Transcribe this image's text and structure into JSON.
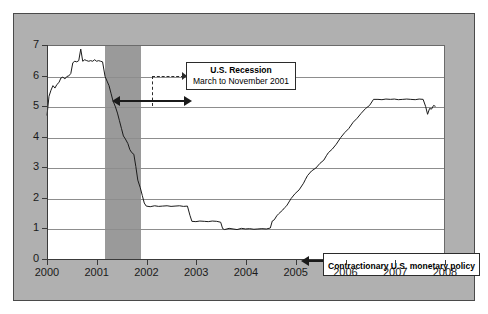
{
  "figure": {
    "background_color": "#b0b0b0",
    "plot_background_color": "#ffffff",
    "border_color": "#4a4a4a"
  },
  "annotations": {
    "recession": {
      "line1": "U.S. Recession",
      "line2": "March to November 2001",
      "band_start": 2001.17,
      "band_end": 2001.88,
      "band_color": "#9a9a9a"
    },
    "policy": {
      "label": "Contractionary U.S. monetary policy",
      "arrow_target_x": 2004.5,
      "arrow_target_y": 1.0
    }
  },
  "chart_data": {
    "type": "line",
    "title": "",
    "subtitle": "",
    "xlabel": "",
    "ylabel": "Percent",
    "xlim": [
      2000,
      2008
    ],
    "ylim": [
      0,
      7
    ],
    "grid": true,
    "legend_position": "none",
    "xticks": [
      2000,
      2001,
      2002,
      2003,
      2004,
      2005,
      2006,
      2007,
      2008
    ],
    "xticklabels": [
      "2000",
      "2001",
      "2002",
      "2003",
      "2004",
      "2005",
      "2006",
      "2007",
      "2008"
    ],
    "yticks": [
      0,
      1,
      2,
      3,
      4,
      5,
      6,
      7
    ],
    "yticklabels": [
      "0",
      "1",
      "2",
      "3",
      "4",
      "5",
      "6",
      "7"
    ],
    "line_color": "#1a1a1a",
    "series": [
      {
        "name": "Federal funds rate",
        "x": [
          2000.0,
          2000.04,
          2000.08,
          2000.12,
          2000.16,
          2000.2,
          2000.24,
          2000.28,
          2000.32,
          2000.36,
          2000.4,
          2000.44,
          2000.48,
          2000.52,
          2000.56,
          2000.6,
          2000.64,
          2000.68,
          2000.72,
          2000.76,
          2000.8,
          2000.84,
          2000.88,
          2000.92,
          2000.96,
          2001.0,
          2001.04,
          2001.08,
          2001.12,
          2001.17,
          2001.21,
          2001.25,
          2001.29,
          2001.33,
          2001.38,
          2001.42,
          2001.46,
          2001.5,
          2001.54,
          2001.58,
          2001.63,
          2001.67,
          2001.71,
          2001.75,
          2001.79,
          2001.83,
          2001.88,
          2001.92,
          2001.96,
          2002.0,
          2002.08,
          2002.17,
          2002.25,
          2002.33,
          2002.42,
          2002.5,
          2002.58,
          2002.67,
          2002.75,
          2002.83,
          2002.88,
          2002.92,
          2003.0,
          2003.08,
          2003.17,
          2003.25,
          2003.33,
          2003.42,
          2003.5,
          2003.54,
          2003.58,
          2003.67,
          2003.75,
          2003.83,
          2003.92,
          2004.0,
          2004.08,
          2004.17,
          2004.25,
          2004.33,
          2004.42,
          2004.5,
          2004.54,
          2004.58,
          2004.63,
          2004.67,
          2004.75,
          2004.79,
          2004.83,
          2004.92,
          2005.0,
          2005.08,
          2005.17,
          2005.21,
          2005.25,
          2005.33,
          2005.42,
          2005.5,
          2005.58,
          2005.63,
          2005.67,
          2005.75,
          2005.83,
          2005.92,
          2006.0,
          2006.08,
          2006.17,
          2006.25,
          2006.33,
          2006.42,
          2006.5,
          2006.58,
          2006.67,
          2006.75,
          2006.83,
          2006.92,
          2007.0,
          2007.08,
          2007.17,
          2007.25,
          2007.33,
          2007.42,
          2007.5,
          2007.58,
          2007.63,
          2007.67,
          2007.71,
          2007.75,
          2007.79,
          2007.83
        ],
        "y": [
          4.72,
          5.35,
          5.55,
          5.7,
          5.62,
          5.74,
          5.8,
          5.95,
          5.98,
          5.92,
          6.0,
          6.02,
          6.1,
          6.45,
          6.5,
          6.48,
          6.52,
          6.9,
          6.5,
          6.55,
          6.52,
          6.5,
          6.52,
          6.5,
          6.55,
          6.5,
          6.52,
          6.5,
          6.48,
          6.0,
          5.85,
          5.7,
          5.45,
          5.2,
          5.0,
          4.8,
          4.55,
          4.3,
          4.05,
          3.95,
          3.8,
          3.6,
          3.5,
          3.45,
          3.05,
          2.6,
          2.35,
          2.1,
          1.85,
          1.75,
          1.73,
          1.76,
          1.74,
          1.75,
          1.76,
          1.74,
          1.75,
          1.76,
          1.74,
          1.75,
          1.45,
          1.25,
          1.24,
          1.26,
          1.25,
          1.24,
          1.26,
          1.25,
          1.22,
          1.01,
          0.98,
          1.02,
          1.0,
          0.98,
          1.02,
          1.0,
          1.01,
          0.99,
          1.0,
          1.01,
          1.0,
          1.03,
          1.26,
          1.3,
          1.43,
          1.5,
          1.62,
          1.7,
          1.76,
          2.0,
          2.16,
          2.28,
          2.5,
          2.63,
          2.75,
          2.9,
          3.0,
          3.15,
          3.26,
          3.4,
          3.5,
          3.62,
          3.78,
          4.0,
          4.16,
          4.29,
          4.5,
          4.63,
          4.79,
          4.95,
          5.05,
          5.25,
          5.25,
          5.24,
          5.26,
          5.25,
          5.26,
          5.24,
          5.25,
          5.26,
          5.25,
          5.24,
          5.26,
          5.25,
          5.02,
          4.76,
          4.95,
          4.93,
          5.05,
          5.02
        ]
      }
    ]
  }
}
